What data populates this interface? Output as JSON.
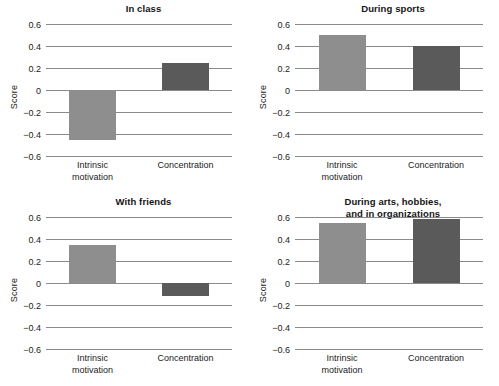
{
  "chart_data": {
    "type": "bar",
    "title": "",
    "ylabel": "Score",
    "xlabel": "",
    "ylim": [
      -0.6,
      0.6
    ],
    "yticks": [
      0.6,
      0.4,
      0.2,
      0,
      -0.2,
      -0.4,
      -0.6
    ],
    "ytick_labels": [
      "0.6",
      "0.4",
      "0.2",
      "0",
      "−0.2",
      "−0.4",
      "−0.6"
    ],
    "grid": true,
    "legend": "none",
    "categories": [
      "Intrinsic\nmotivation",
      "Concentration"
    ],
    "series": [
      {
        "name": "Intrinsic motivation",
        "color": "#8e8e8e"
      },
      {
        "name": "Concentration",
        "color": "#5a5a5a"
      }
    ],
    "panels": [
      {
        "title": "In class",
        "values": [
          -0.45,
          0.25
        ]
      },
      {
        "title": "During sports",
        "values": [
          0.5,
          0.4
        ]
      },
      {
        "title": "With friends",
        "values": [
          0.35,
          -0.12
        ]
      },
      {
        "title": "During arts, hobbies,\nand in organizations",
        "values": [
          0.55,
          0.58
        ]
      }
    ]
  },
  "colors": {
    "bar_light": "#8e8e8e",
    "bar_dark": "#5a5a5a",
    "gridline": "#8a8a8a",
    "background": "#ffffff",
    "text": "#1b1b1b"
  }
}
